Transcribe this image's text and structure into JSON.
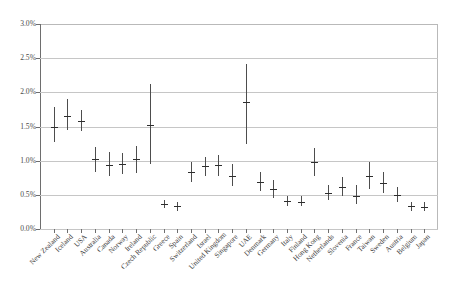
{
  "chart_data": {
    "type": "scatter",
    "title": "",
    "subtitle": "",
    "xlabel": "",
    "ylabel": "",
    "ylim": [
      0,
      3
    ],
    "ytick_labels": [
      "3.0%",
      "2.5%",
      "2.0%",
      "1.5%",
      "1.0%",
      "0.5%",
      "0.0%"
    ],
    "ytick_values": [
      3.0,
      2.5,
      2.0,
      1.5,
      1.0,
      0.5,
      0.0
    ],
    "grid": true,
    "legend": "none",
    "value_unit": "percent",
    "marker_style": "point-estimate-with-range-bar",
    "categories": [
      "New Zealand",
      "Iceland",
      "USA",
      "Australia",
      "Canada",
      "Norway",
      "Ireland",
      "Czech Republic",
      "Greece",
      "Spain",
      "Switzerland",
      "Israel",
      "United Kingdom",
      "Singapore",
      "UAE",
      "Denmark",
      "Germany",
      "Italy",
      "Finland",
      "Hong Kong",
      "Netherlands",
      "Slovenia",
      "France",
      "Taiwan",
      "Sweden",
      "Austria",
      "Belgium",
      "Japan"
    ],
    "series": [
      {
        "name": "point estimate",
        "values": [
          1.5,
          1.66,
          1.58,
          1.02,
          0.94,
          0.95,
          1.02,
          1.52,
          0.36,
          0.33,
          0.83,
          0.92,
          0.93,
          0.78,
          1.86,
          0.69,
          0.58,
          0.41,
          0.4,
          0.98,
          0.53,
          0.62,
          0.49,
          0.78,
          0.68,
          0.5,
          0.33,
          0.32
        ]
      },
      {
        "name": "range low",
        "values": [
          1.27,
          1.45,
          1.43,
          0.83,
          0.77,
          0.8,
          0.82,
          0.95,
          0.3,
          0.27,
          0.69,
          0.78,
          0.77,
          0.63,
          1.25,
          0.55,
          0.46,
          0.34,
          0.33,
          0.78,
          0.42,
          0.49,
          0.36,
          0.58,
          0.53,
          0.4,
          0.27,
          0.26
        ]
      },
      {
        "name": "range high",
        "values": [
          1.79,
          1.9,
          1.74,
          1.2,
          1.12,
          1.11,
          1.21,
          2.12,
          0.43,
          0.4,
          0.98,
          1.06,
          1.09,
          0.95,
          2.41,
          0.84,
          0.71,
          0.49,
          0.48,
          1.18,
          0.64,
          0.76,
          0.64,
          0.98,
          0.83,
          0.61,
          0.4,
          0.39
        ]
      }
    ]
  }
}
